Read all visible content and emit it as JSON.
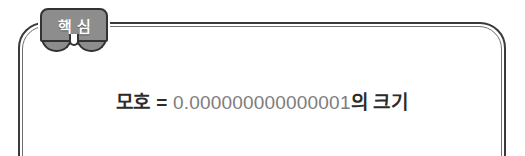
{
  "page": {
    "width": 525,
    "height": 156,
    "background": "#ffffff"
  },
  "callout": {
    "badge": {
      "name": "핵심",
      "char1": "핵",
      "char2": "심",
      "fill_color": "#8d8d8d",
      "stroke_color": "#333333",
      "text_color": "#ffffff"
    },
    "frame": {
      "outer_stroke": "#3a3a3a",
      "inner_stroke": "#6f6f6f"
    },
    "body": {
      "prefix": "모호 = ",
      "number": "0.000000000000001",
      "suffix": "의 크기",
      "full_text": "모호 = 0.000000000000001의 크기",
      "text_color": "#2b2b2b",
      "number_color": "#7d7d7d"
    }
  }
}
